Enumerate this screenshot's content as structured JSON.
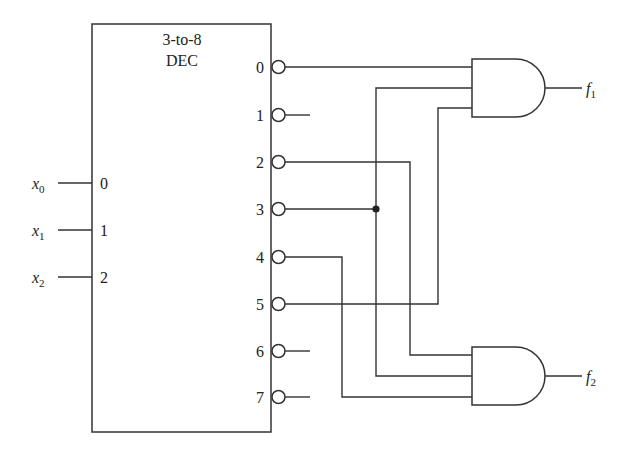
{
  "decoder": {
    "title_line1": "3-to-8",
    "title_line2": "DEC",
    "inputs": [
      {
        "index": "0",
        "signal": "x",
        "sub": "0"
      },
      {
        "index": "1",
        "signal": "x",
        "sub": "1"
      },
      {
        "index": "2",
        "signal": "x",
        "sub": "2"
      }
    ],
    "outputs": [
      "0",
      "1",
      "2",
      "3",
      "4",
      "5",
      "6",
      "7"
    ],
    "outputs_active_low": true
  },
  "gates": [
    {
      "type": "AND",
      "output": {
        "signal": "f",
        "sub": "1"
      },
      "inputs_from_decoder": [
        "0",
        "3",
        "5"
      ]
    },
    {
      "type": "AND",
      "output": {
        "signal": "f",
        "sub": "2"
      },
      "inputs_from_decoder": [
        "2",
        "3",
        "4"
      ]
    }
  ],
  "colors": {
    "line": "#333333",
    "background": "#ffffff"
  }
}
